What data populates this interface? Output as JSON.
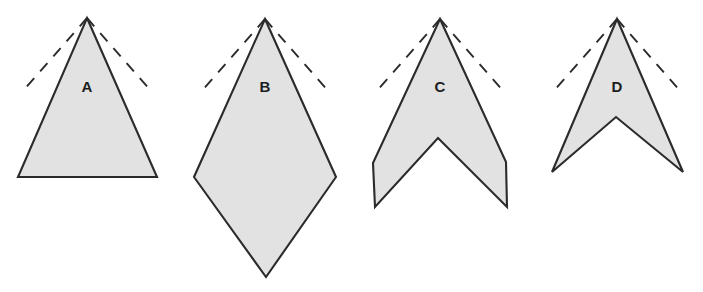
{
  "figure": {
    "background_color": "#ffffff",
    "fill_color": "#e2e2e2",
    "stroke_color": "#2b2b2b",
    "width": 703,
    "height": 292
  },
  "chart_data": {
    "type": "diagram",
    "xlabel": "",
    "ylabel": "",
    "grid": false,
    "legend": "none",
    "shapes": [
      {
        "label": "A",
        "name": "triangle",
        "label_x": 87,
        "label_y": 88,
        "polygon": "87,18 157,177 18,177",
        "apex": [
          87,
          18
        ],
        "notch_depth": 0,
        "description": "isosceles triangle, flat base"
      },
      {
        "label": "B",
        "name": "kite",
        "label_x": 265,
        "label_y": 88,
        "polygon": "265,19 336,177 266,277 194,177",
        "apex": [
          265,
          19
        ],
        "notch_depth": 0,
        "description": "kite / rhombus with lower point"
      },
      {
        "label": "C",
        "name": "chevron-shallow",
        "label_x": 440,
        "label_y": 88,
        "polygon": "440,19 506,162 507,207 438,138 375,207 373,163",
        "apex": [
          440,
          19
        ],
        "notch_depth": 69,
        "description": "chevron with moderate concave notch and squared wing ends"
      },
      {
        "label": "D",
        "name": "chevron-deep",
        "label_x": 617,
        "label_y": 88,
        "polygon": "617,19 683,172 616,117 552,172",
        "apex": [
          617,
          19
        ],
        "notch_depth": 55,
        "description": "deep dart with sharp swept-back wings"
      }
    ],
    "guide_lines": [
      {
        "shape": "A",
        "side": "left",
        "from": [
          87,
          18
        ],
        "to": [
          22,
          92
        ],
        "style": "dashed"
      },
      {
        "shape": "A",
        "side": "right",
        "from": [
          87,
          18
        ],
        "to": [
          152,
          92
        ],
        "style": "dashed"
      },
      {
        "shape": "B",
        "side": "left",
        "from": [
          265,
          19
        ],
        "to": [
          200,
          93
        ],
        "style": "dashed"
      },
      {
        "shape": "B",
        "side": "right",
        "from": [
          265,
          19
        ],
        "to": [
          330,
          93
        ],
        "style": "dashed"
      },
      {
        "shape": "C",
        "side": "left",
        "from": [
          440,
          19
        ],
        "to": [
          375,
          93
        ],
        "style": "dashed"
      },
      {
        "shape": "C",
        "side": "right",
        "from": [
          440,
          19
        ],
        "to": [
          505,
          93
        ],
        "style": "dashed"
      },
      {
        "shape": "D",
        "side": "left",
        "from": [
          617,
          19
        ],
        "to": [
          552,
          93
        ],
        "style": "dashed"
      },
      {
        "shape": "D",
        "side": "right",
        "from": [
          617,
          19
        ],
        "to": [
          682,
          93
        ],
        "style": "dashed"
      }
    ]
  }
}
